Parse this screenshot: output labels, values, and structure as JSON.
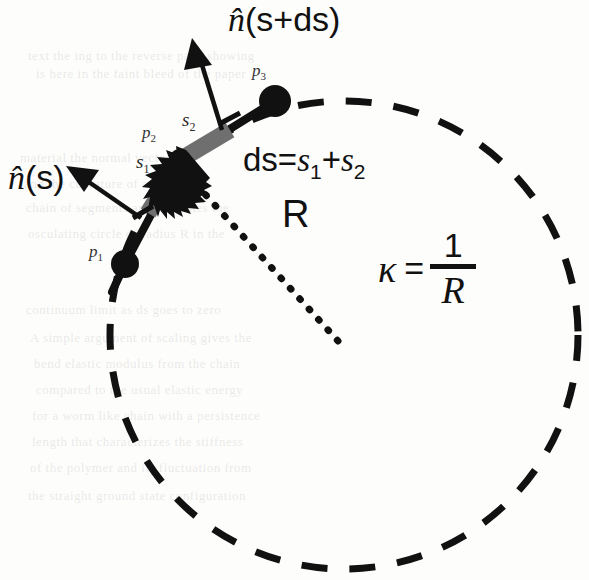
{
  "figure": {
    "kind": "geometry-diagram",
    "title_label": {
      "italic": "n̂",
      "rest": "(s+ds)"
    },
    "normal_label": {
      "italic": "n̂",
      "rest": "(s)"
    },
    "points": [
      {
        "id": "p1",
        "base": "p",
        "sub": "1",
        "x": 125,
        "y": 264
      },
      {
        "id": "p2",
        "base": "p",
        "sub": "2",
        "x": 180,
        "y": 160
      },
      {
        "id": "p3",
        "base": "p",
        "sub": "3",
        "x": 275,
        "y": 101
      }
    ],
    "point_labels": [
      {
        "base": "p",
        "sub": "1",
        "x": 89,
        "y": 243
      },
      {
        "base": "p",
        "sub": "2",
        "x": 142,
        "y": 124
      },
      {
        "base": "p",
        "sub": "3",
        "x": 252,
        "y": 68
      }
    ],
    "segment_labels": [
      {
        "base": "s",
        "sub": "1",
        "x": 142,
        "y": 155
      },
      {
        "base": "s",
        "sub": "2",
        "x": 185,
        "y": 113
      }
    ],
    "ds_formula": {
      "lead": "ds=",
      "s": "s",
      "sub1": "1",
      "plus": "+",
      "sub2": "2"
    },
    "radius_label": "R",
    "curvature": {
      "symbol": "κ",
      "equals": "=",
      "numerator": "1",
      "denominator": "R"
    },
    "circle": {
      "cx": 344,
      "cy": 335,
      "r": 234,
      "style": "dashed"
    },
    "radius_line": {
      "from_x": 335,
      "from_y": 340,
      "to_x": 193,
      "to_y": 180,
      "style": "dotted"
    },
    "colors": {
      "ink": "#111111",
      "segment_gray": "#6f6f6f",
      "paper": "#fdfdfb",
      "label_gray": "#333333"
    },
    "bleed_through_lines": [
      {
        "text": "text the ing to the reverse page showing",
        "x": 28,
        "y": 48
      },
      {
        "text": "is here in the faint bleed of the paper",
        "x": 36,
        "y": 66
      },
      {
        "text": "material the normal vectors are",
        "x": 20,
        "y": 150
      },
      {
        "text": "and the curvature of a discrete",
        "x": 24,
        "y": 176
      },
      {
        "text": "chain of segments approximates the",
        "x": 26,
        "y": 200
      },
      {
        "text": "osculating circle of radius R in the",
        "x": 28,
        "y": 226
      },
      {
        "text": "continuum limit as ds goes to zero",
        "x": 26,
        "y": 302
      },
      {
        "text": "A simple argument of scaling gives the",
        "x": 30,
        "y": 330
      },
      {
        "text": "bend elastic modulus from the chain",
        "x": 34,
        "y": 356
      },
      {
        "text": "compared to the usual elastic energy",
        "x": 36,
        "y": 382
      },
      {
        "text": "for a worm like chain with a persistence",
        "x": 32,
        "y": 408
      },
      {
        "text": "length that characterizes the stiffness",
        "x": 32,
        "y": 434
      },
      {
        "text": "of the polymer and its fluctuation from",
        "x": 30,
        "y": 460
      },
      {
        "text": "the straight ground state configuration",
        "x": 28,
        "y": 488
      }
    ]
  }
}
